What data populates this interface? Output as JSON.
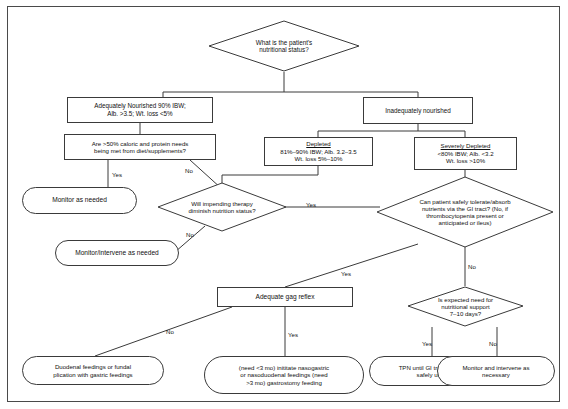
{
  "document": {
    "type": "clinical-decision-flowchart",
    "title": "Nutritional status assessment algorithm"
  },
  "nodes": {
    "start": {
      "shape": "diamond",
      "lines": [
        "What is the patient's",
        "nutritional status?"
      ]
    },
    "adequately_nourished": {
      "shape": "rect",
      "lines": [
        "Adequately Nourished 90% IBW;",
        "Alb. >3.5; Wt. loss <5%"
      ]
    },
    "inadequately_nourished": {
      "shape": "rect",
      "lines": [
        "Inadequately nourished"
      ]
    },
    "caloric_needs_q": {
      "shape": "rect",
      "lines": [
        "Are >50% caloric and protein needs",
        "being met from diet/supplements?"
      ]
    },
    "depleted": {
      "shape": "rect",
      "heading": "Depleted",
      "lines": [
        "81%–90% IBW; Alb. 3.2–3.5",
        "Wt. loss 5%–10%"
      ]
    },
    "severely_depleted": {
      "shape": "rect",
      "heading": "Severely Depleted",
      "lines": [
        "<80% IBW; Alb. <3.2",
        "Wt. loss >10%"
      ]
    },
    "monitor_as_needed": {
      "shape": "rounded",
      "lines": [
        "Monitor as needed"
      ]
    },
    "impending_therapy_q": {
      "shape": "diamond",
      "lines": [
        "Will impending therapy",
        "diminish nutrition status?"
      ]
    },
    "monitor_intervene_as_needed": {
      "shape": "rounded",
      "lines": [
        "Monitor/intervene as needed"
      ]
    },
    "gi_tract_q": {
      "shape": "diamond",
      "lines": [
        "Can patient safely tolerate/absorb",
        "nutrients via the GI tract? (No, if",
        "thrombocytopenia present or",
        "anticipated or ileus)"
      ]
    },
    "adequate_gag_reflex": {
      "shape": "rect",
      "lines": [
        "Adequate gag reflex"
      ]
    },
    "expected_need_q": {
      "shape": "diamond",
      "lines": [
        "Is expected need for",
        "nutritional support",
        "7–10 days?"
      ]
    },
    "duodenal_feedings": {
      "shape": "rounded",
      "lines": [
        "Duodenal feedings or fundal",
        "plication with gastric feedings"
      ]
    },
    "nasogastric_feedings": {
      "shape": "rounded",
      "lines": [
        "(need <3 mo) inititate nasogastric",
        "or nasoduodenal feedings (need",
        ">3 mo) gastrostomy feeding"
      ]
    },
    "tpn": {
      "shape": "rounded",
      "lines": [
        "TPN until GI tract can be",
        "safely used"
      ]
    },
    "monitor_intervene_necessary": {
      "shape": "rounded",
      "lines": [
        "Monitor and intervene as",
        "necessary"
      ]
    }
  },
  "edge_labels": {
    "caloric_yes": "Yes",
    "caloric_no": "No",
    "therapy_yes": "Yes",
    "therapy_no": "No",
    "gi_yes": "Yes",
    "gi_no": "No",
    "gag_yes": "Yes",
    "gag_no": "No",
    "expected_yes": "Yes",
    "expected_no": "No"
  },
  "colors": {
    "stroke": "#3a3a3a",
    "text": "#101010",
    "background": "#ffffff",
    "page_surround": "#8e8e8e"
  }
}
